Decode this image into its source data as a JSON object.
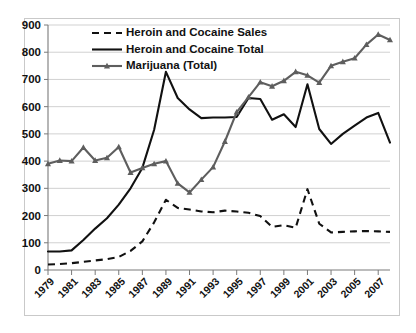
{
  "chart_data": {
    "type": "line",
    "title": "",
    "subtitle": "",
    "xlabel": "",
    "ylabel": "",
    "xlim": [
      1979,
      2008
    ],
    "ylim": [
      0,
      900
    ],
    "ytick_step": 100,
    "grid": true,
    "legend_position": "top-center",
    "x": [
      1979,
      1980,
      1981,
      1982,
      1983,
      1984,
      1985,
      1986,
      1987,
      1988,
      1989,
      1990,
      1991,
      1992,
      1993,
      1994,
      1995,
      1996,
      1997,
      1998,
      1999,
      2000,
      2001,
      2002,
      2003,
      2004,
      2005,
      2006,
      2007,
      2008
    ],
    "xtick_labels": [
      "1979",
      "1981",
      "1983",
      "1985",
      "1987",
      "1989",
      "1991",
      "1993",
      "1995",
      "1997",
      "1999",
      "2001",
      "2003",
      "2005",
      "2007"
    ],
    "ytick_labels": [
      "0",
      "100",
      "200",
      "300",
      "400",
      "500",
      "600",
      "700",
      "800",
      "900"
    ],
    "series": [
      {
        "name": "Heroin and Cocaine Sales",
        "style": "dashed",
        "color": "#111111",
        "marker": "none",
        "values": [
          20,
          22,
          25,
          30,
          35,
          40,
          48,
          70,
          105,
          175,
          258,
          228,
          222,
          215,
          212,
          218,
          215,
          210,
          198,
          158,
          165,
          155,
          297,
          170,
          138,
          140,
          142,
          143,
          142,
          140
        ]
      },
      {
        "name": "Heroin and Cocaine Total",
        "style": "solid",
        "color": "#111111",
        "marker": "none",
        "values": [
          68,
          68,
          72,
          110,
          152,
          190,
          240,
          300,
          375,
          515,
          728,
          632,
          590,
          558,
          560,
          560,
          562,
          632,
          628,
          552,
          572,
          525,
          682,
          518,
          463,
          500,
          530,
          560,
          577,
          468
        ]
      },
      {
        "name": "Marijuana (Total)",
        "style": "solid-marker",
        "color": "#5e5e5e",
        "marker": "triangle",
        "values": [
          390,
          402,
          400,
          450,
          402,
          412,
          452,
          358,
          375,
          390,
          400,
          318,
          285,
          332,
          378,
          472,
          580,
          635,
          690,
          675,
          695,
          728,
          715,
          688,
          750,
          765,
          778,
          828,
          865,
          845
        ]
      }
    ]
  },
  "legend": {
    "items": [
      {
        "label": "Heroin and Cocaine Sales",
        "style": "dashed"
      },
      {
        "label": "Heroin and Cocaine Total",
        "style": "solid"
      },
      {
        "label": "Marijuana (Total)",
        "style": "solid-marker"
      }
    ]
  },
  "axes": {
    "y": {
      "labels": [
        "900",
        "800",
        "700",
        "600",
        "500",
        "400",
        "300",
        "200",
        "100",
        "0"
      ]
    },
    "x": {
      "labels": [
        "1979",
        "1981",
        "1983",
        "1985",
        "1987",
        "1989",
        "1991",
        "1993",
        "1995",
        "1997",
        "1999",
        "2001",
        "2003",
        "2005",
        "2007"
      ]
    }
  },
  "colors": {
    "series_dark": "#111111",
    "series_gray": "#5e5e5e",
    "grid": "#bdbdbd",
    "axis": "#7a7a7a",
    "frame": "#c9c9c9",
    "background": "#ffffff"
  }
}
